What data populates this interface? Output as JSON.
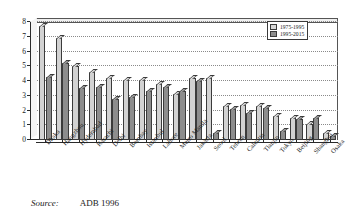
{
  "chart_data": {
    "type": "bar",
    "title": "",
    "subtitle": "",
    "xlabel": "",
    "ylabel": "",
    "ylim": [
      0,
      8
    ],
    "yticks": [
      0,
      1,
      2,
      3,
      4,
      5,
      6,
      7,
      8
    ],
    "grid": true,
    "legend_position": "top-right",
    "categories": [
      "Dhaka",
      "Hangzhou",
      "Hyderabad",
      "Karachi",
      "Delhi",
      "Bombay",
      "Istanbul",
      "Lahore",
      "Metro Manila",
      "Jakarta",
      "Seoul",
      "Tehran",
      "Calcutta",
      "Tianjin",
      "Tokyo",
      "Beijing",
      "Shanghai",
      "Osaka"
    ],
    "series": [
      {
        "name": "1975-1995",
        "color": "#d2d2d2",
        "values": [
          7.7,
          6.9,
          5.0,
          4.6,
          4.2,
          4.1,
          4.1,
          3.8,
          3.1,
          4.2,
          4.2,
          2.3,
          2.4,
          2.3,
          1.6,
          1.5,
          1.1,
          0.5
        ]
      },
      {
        "name": "1995-2015",
        "color": "#8d8d8d",
        "values": [
          4.3,
          5.2,
          3.5,
          3.6,
          2.8,
          2.9,
          3.3,
          3.6,
          3.3,
          4.0,
          0.5,
          2.1,
          1.8,
          2.2,
          0.6,
          1.4,
          1.5,
          0.3
        ]
      }
    ]
  },
  "legend": {
    "items": [
      {
        "label": "1975-1995"
      },
      {
        "label": "1995-2015"
      }
    ]
  },
  "source": {
    "label": "Source:",
    "value": "ADB 1996"
  }
}
